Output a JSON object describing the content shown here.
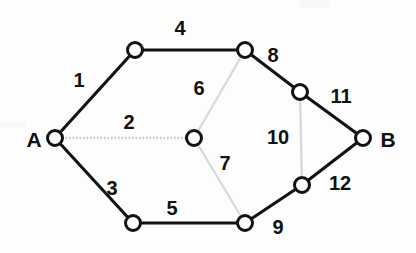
{
  "figure": {
    "type": "graph-diagram",
    "width": 416,
    "height": 253,
    "background_color": "#fdfdfd",
    "solid_edge_color": "#121212",
    "faint_edge_color": "#d8d8d8",
    "dotted_edge_color": "#c9c9c9",
    "node_fill_color": "#ffffff",
    "node_stroke_color": "#121212",
    "label_color": "#111111"
  },
  "nodes": [
    {
      "id": "A",
      "label": "A",
      "label_x": 34,
      "label_y": 139,
      "x": 55,
      "y": 138,
      "r": 7.5,
      "has_text_label": true
    },
    {
      "id": "n1",
      "label": "",
      "label_x": 0,
      "label_y": 0,
      "x": 135,
      "y": 50,
      "r": 7.5,
      "has_text_label": false
    },
    {
      "id": "n2",
      "label": "",
      "label_x": 0,
      "label_y": 0,
      "x": 245,
      "y": 50,
      "r": 7.5,
      "has_text_label": false
    },
    {
      "id": "n3",
      "label": "",
      "label_x": 0,
      "label_y": 0,
      "x": 194,
      "y": 138,
      "r": 7.5,
      "has_text_label": false
    },
    {
      "id": "n4",
      "label": "",
      "label_x": 0,
      "label_y": 0,
      "x": 133,
      "y": 223,
      "r": 7.5,
      "has_text_label": false
    },
    {
      "id": "n5",
      "label": "",
      "label_x": 0,
      "label_y": 0,
      "x": 245,
      "y": 223,
      "r": 7.5,
      "has_text_label": false
    },
    {
      "id": "n6",
      "label": "",
      "label_x": 0,
      "label_y": 0,
      "x": 300,
      "y": 92,
      "r": 7.5,
      "has_text_label": false
    },
    {
      "id": "n7",
      "label": "",
      "label_x": 0,
      "label_y": 0,
      "x": 302,
      "y": 185,
      "r": 7.5,
      "has_text_label": false
    },
    {
      "id": "B",
      "label": "B",
      "label_x": 388,
      "label_y": 139,
      "x": 363,
      "y": 138,
      "r": 7.5,
      "has_text_label": true
    }
  ],
  "edges": [
    {
      "id": "e1",
      "label": "1",
      "from": "A",
      "to": "n1",
      "style": "solid",
      "label_x": 79,
      "label_y": 80
    },
    {
      "id": "e2",
      "label": "2",
      "from": "A",
      "to": "n3",
      "style": "dotted",
      "label_x": 129,
      "label_y": 122
    },
    {
      "id": "e3",
      "label": "3",
      "from": "A",
      "to": "n4",
      "style": "solid",
      "label_x": 112,
      "label_y": 188
    },
    {
      "id": "e4",
      "label": "4",
      "from": "n1",
      "to": "n2",
      "style": "solid",
      "label_x": 180,
      "label_y": 28
    },
    {
      "id": "e5",
      "label": "5",
      "from": "n4",
      "to": "n5",
      "style": "solid",
      "label_x": 172,
      "label_y": 208
    },
    {
      "id": "e6",
      "label": "6",
      "from": "n3",
      "to": "n2",
      "style": "faint",
      "label_x": 199,
      "label_y": 88
    },
    {
      "id": "e7",
      "label": "7",
      "from": "n3",
      "to": "n5",
      "style": "faint",
      "label_x": 225,
      "label_y": 163
    },
    {
      "id": "e8",
      "label": "8",
      "from": "n2",
      "to": "n6",
      "style": "solid",
      "label_x": 273,
      "label_y": 55
    },
    {
      "id": "e9",
      "label": "9",
      "from": "n5",
      "to": "n7",
      "style": "solid",
      "label_x": 278,
      "label_y": 227
    },
    {
      "id": "e10",
      "label": "10",
      "from": "n6",
      "to": "n7",
      "style": "faint",
      "label_x": 278,
      "label_y": 137
    },
    {
      "id": "e11",
      "label": "11",
      "from": "n6",
      "to": "B",
      "style": "solid",
      "label_x": 341,
      "label_y": 96
    },
    {
      "id": "e12",
      "label": "12",
      "from": "n7",
      "to": "B",
      "style": "solid",
      "label_x": 340,
      "label_y": 183
    }
  ]
}
